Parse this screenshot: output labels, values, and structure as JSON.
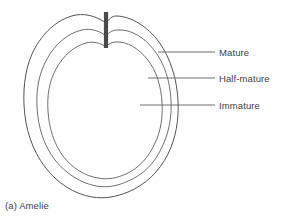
{
  "figure": {
    "caption": "(a) Amelie",
    "background_color": "#ffffff",
    "outline_color": "#3f3f3f",
    "leader_line_color": "#7a7a7a",
    "stem_color": "#4a4a4a",
    "text_color": "#3d3d3d"
  },
  "annotations": [
    {
      "id": "mature",
      "label": "Mature",
      "icon": "leader-line-icon",
      "leader_start_x": 158,
      "leader_end_x": 215,
      "leader_y": 52,
      "zone": "outermost"
    },
    {
      "id": "half-mature",
      "label": "Half-mature",
      "icon": "leader-line-icon",
      "leader_start_x": 148,
      "leader_end_x": 215,
      "leader_y": 78,
      "zone": "middle"
    },
    {
      "id": "immature",
      "label": "Immature",
      "icon": "leader-line-icon",
      "leader_start_x": 140,
      "leader_end_x": 215,
      "leader_y": 105,
      "zone": "innermost"
    }
  ],
  "contours": [
    {
      "id": "mature-contour",
      "name": "outer apple outline"
    },
    {
      "id": "half-mature-contour",
      "name": "middle apple outline"
    },
    {
      "id": "immature-contour",
      "name": "inner apple outline"
    }
  ],
  "stem": {
    "id": "apple-stem",
    "name": "stem"
  }
}
